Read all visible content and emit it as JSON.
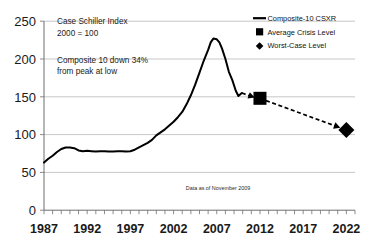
{
  "chart_data": {
    "type": "line",
    "title": "",
    "xlabel": "",
    "ylabel": "",
    "xlim": [
      1987,
      2023
    ],
    "ylim": [
      0,
      250
    ],
    "yticks": [
      0,
      50,
      100,
      150,
      200,
      250
    ],
    "xticks": [
      1987,
      1992,
      1997,
      2002,
      2007,
      2012,
      2017,
      2022
    ],
    "xtick_labels": [
      "1987",
      "1992",
      "1997",
      "2002",
      "2007",
      "2012",
      "2017",
      "2022"
    ],
    "ytick_labels": [
      "0",
      "50",
      "100",
      "150",
      "200",
      "250"
    ],
    "minor_xtick_interval": 1,
    "grid": "horizontal",
    "legend_position": "top-right",
    "series": [
      {
        "name": "Composite-10 CSXR",
        "style": "solid-line",
        "x": [
          1987.0,
          1987.5,
          1988.0,
          1988.5,
          1989.0,
          1989.5,
          1990.0,
          1990.5,
          1991.0,
          1991.5,
          1992.0,
          1992.5,
          1993.0,
          1993.5,
          1994.0,
          1994.5,
          1995.0,
          1995.5,
          1996.0,
          1996.5,
          1997.0,
          1997.5,
          1998.0,
          1998.5,
          1999.0,
          1999.5,
          2000.0,
          2000.5,
          2001.0,
          2001.5,
          2002.0,
          2002.5,
          2003.0,
          2003.5,
          2004.0,
          2004.5,
          2005.0,
          2005.5,
          2006.0,
          2006.3,
          2006.6,
          2007.0,
          2007.3,
          2007.6,
          2008.0,
          2008.4,
          2008.8,
          2009.2,
          2009.5,
          2009.9
        ],
        "y": [
          63,
          68,
          72,
          77,
          81,
          83,
          83,
          82,
          79,
          78,
          78.5,
          78,
          77.5,
          78,
          78,
          77.5,
          77.5,
          78,
          78,
          77.5,
          78,
          80,
          83,
          86,
          89,
          93,
          99,
          103,
          107,
          112,
          117,
          123,
          130,
          140,
          152,
          166,
          182,
          198,
          212,
          222,
          227,
          226,
          222,
          214,
          200,
          183,
          172,
          158,
          151,
          155
        ]
      },
      {
        "name": "Average Crisis Level",
        "style": "square-marker",
        "x": [
          2012
        ],
        "y": [
          148
        ]
      },
      {
        "name": "Worst-Case Level",
        "style": "diamond-marker",
        "x": [
          2022
        ],
        "y": [
          106
        ]
      }
    ],
    "projection_arrows": [
      {
        "from": [
          2009.9,
          155
        ],
        "to": [
          2011.4,
          149
        ],
        "style": "dashed-arrow"
      },
      {
        "from": [
          2012.7,
          145
        ],
        "to": [
          2021.3,
          109
        ],
        "style": "dashed-arrow"
      }
    ],
    "annotations": [
      {
        "name": "index-title",
        "lines": [
          "Case Schiller Index",
          "2000 = 100"
        ]
      },
      {
        "name": "decline-note",
        "lines": [
          "Composite 10 down 34%",
          "from peak at low"
        ]
      },
      {
        "name": "data-date",
        "lines": [
          "Data as of November 2009"
        ]
      }
    ]
  },
  "annotations": {
    "index_title_line1": "Case Schiller Index",
    "index_title_line2": "2000 = 100",
    "decline_line1": "Composite 10 down 34%",
    "decline_line2": "from peak at low",
    "footnote": "Data as of November 2009"
  },
  "legend": {
    "items": [
      {
        "label": "Composite-10 CSXR",
        "marker": "line"
      },
      {
        "label": "Average Crisis Level",
        "marker": "square"
      },
      {
        "label": "Worst-Case Level",
        "marker": "diamond"
      }
    ]
  },
  "axes": {
    "y_labels": [
      "250",
      "200",
      "150",
      "100",
      "50",
      "0"
    ],
    "x_labels": [
      "1987",
      "1992",
      "1997",
      "2002",
      "2007",
      "2012",
      "2017",
      "2022"
    ]
  },
  "colors": {
    "line": "#000000",
    "grid": "#b9b9b9",
    "axis": "#6f6f6f",
    "text": "#161616",
    "background": "#ffffff"
  }
}
